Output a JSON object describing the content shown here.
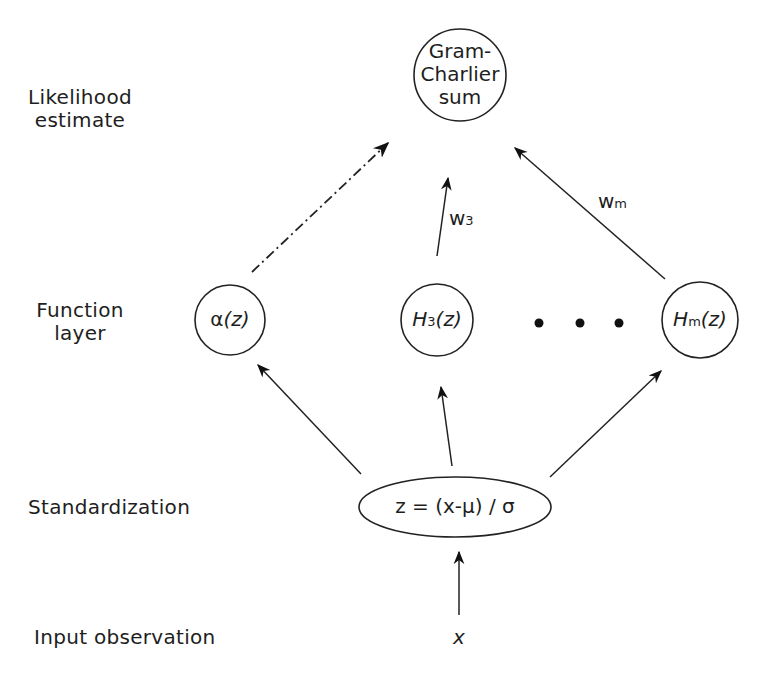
{
  "layers": {
    "output": "Likelihood estimate",
    "output_line1": "Likelihood",
    "output_line2": "estimate",
    "function": "Function layer",
    "function_line1": "Function",
    "function_line2": "layer",
    "standardization": "Standardization",
    "input": "Input observation"
  },
  "nodes": {
    "sum": {
      "line1": "Gram-",
      "line2": "Charlier",
      "line3": "sum"
    },
    "alpha": {
      "symbol": "α",
      "arg": "(z)"
    },
    "h3": {
      "symbol": "H",
      "sub": "3",
      "arg": "(z)"
    },
    "hm": {
      "symbol": "H",
      "sub": "m",
      "arg": "(z)"
    },
    "ellipsis": "• • •",
    "standardize": {
      "formula": "z = (x-μ) / σ"
    },
    "input": {
      "symbol": "x"
    }
  },
  "weights": {
    "w3": {
      "symbol": "w",
      "sub": "3"
    },
    "wm": {
      "symbol": "w",
      "sub": "m"
    }
  },
  "edges": [
    {
      "from": "input",
      "to": "standardize",
      "style": "solid"
    },
    {
      "from": "standardize",
      "to": "alpha",
      "style": "solid"
    },
    {
      "from": "standardize",
      "to": "h3",
      "style": "solid"
    },
    {
      "from": "standardize",
      "to": "hm",
      "style": "solid"
    },
    {
      "from": "alpha",
      "to": "sum",
      "style": "dash-dot"
    },
    {
      "from": "h3",
      "to": "sum",
      "style": "solid",
      "label": "w3"
    },
    {
      "from": "hm",
      "to": "sum",
      "style": "solid",
      "label": "wm"
    }
  ]
}
